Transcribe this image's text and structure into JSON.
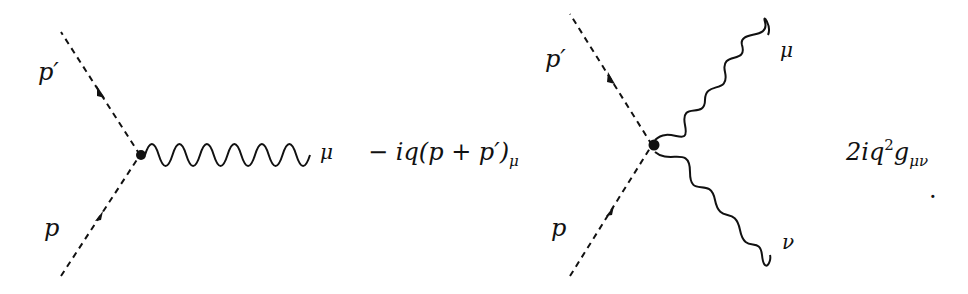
{
  "diagrams": [
    {
      "name": "scalar-photon-vertex",
      "incoming_label": "p",
      "outgoing_label": "p′",
      "photon_label": "μ",
      "vertex_factor": {
        "prefix": "− iq(p + p′)",
        "subscript": "μ"
      }
    },
    {
      "name": "seagull-vertex",
      "incoming_label": "p",
      "outgoing_label": "p′",
      "photon_labels": [
        "μ",
        "ν"
      ],
      "vertex_factor": {
        "coefficient": "2iq",
        "superscript": "2",
        "metric": "g",
        "subscript": "μν"
      },
      "trailing_mark": "."
    }
  ],
  "colors": {
    "line": "#111111",
    "background": "#ffffff"
  }
}
